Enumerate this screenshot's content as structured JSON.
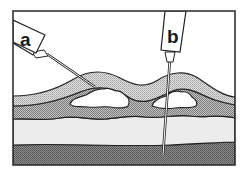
{
  "diagram": {
    "type": "medical-illustration",
    "labels": {
      "a": "a",
      "b": "b"
    },
    "layers": [
      {
        "name": "outer-skin-layer",
        "fill": "hatched-mid-grey"
      },
      {
        "name": "upper-tissue-layer",
        "fill": "hatched-mid-grey"
      },
      {
        "name": "light-tissue-layer",
        "fill": "light-grey"
      },
      {
        "name": "deep-tissue-layer",
        "fill": "hatched-dark-grey"
      }
    ],
    "needles": [
      {
        "id": "a",
        "orientation": "oblique",
        "target": "pocket under first bump"
      },
      {
        "id": "b",
        "orientation": "near-vertical",
        "target": "deep tissue layer"
      }
    ],
    "pockets": [
      {
        "id": "pocket-1",
        "fill": "white",
        "under": "first bump"
      },
      {
        "id": "pocket-2",
        "fill": "white",
        "under": "second bump"
      }
    ]
  },
  "colors": {
    "outline": "#222222",
    "background": "#ffffff",
    "hatch_light": "#cfcfcf",
    "hatch_mid": "#9a9a9a",
    "hatch_dark": "#6e6e6e",
    "light_band": "#ececec"
  }
}
